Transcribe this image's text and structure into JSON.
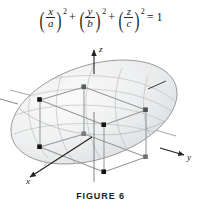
{
  "figure": {
    "caption": "FIGURE 6",
    "equation": {
      "term1": {
        "numerator": "x",
        "denominator": "a",
        "exponent": "2"
      },
      "term2": {
        "numerator": "y",
        "denominator": "b",
        "exponent": "2"
      },
      "term3": {
        "numerator": "z",
        "denominator": "c",
        "exponent": "2"
      },
      "plus1": "+",
      "plus2": "+",
      "equals": "= 1",
      "open_paren": "(",
      "close_paren": ")",
      "plaintext": "(x/a)^2 + (y/b)^2 + (z/c)^2 = 1"
    },
    "axes": {
      "x_label": "x",
      "y_label": "y",
      "z_label": "z"
    },
    "surface": {
      "name": "ellipsoid",
      "fill_color": "#eceded",
      "outline_color": "#8d9093",
      "gridline_color": "#b9bcbe"
    },
    "inscribed_box": {
      "name": "rectangular box",
      "edge_color": "#9a9d9f",
      "vertex_color": "#141414",
      "vertex_count": "8"
    }
  }
}
